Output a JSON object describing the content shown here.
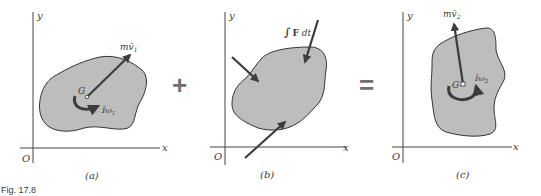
{
  "figure": {
    "caption": "Fig. 17.8",
    "operators": {
      "plus": "+",
      "equals": "="
    },
    "colors": {
      "body_fill": "#bdbdbd",
      "outline": "#333333",
      "arrow": "#3c3c3c",
      "axis": "#444444",
      "operator": "#707070"
    }
  },
  "panels": [
    {
      "id": "a",
      "label": "(a)",
      "axes": {
        "x": "x",
        "y": "y",
        "origin": "O"
      },
      "center_label": "G",
      "momentum_label": "mv̄",
      "momentum_sub": "1",
      "angular_label": "Īω",
      "angular_sub": "1"
    },
    {
      "id": "b",
      "label": "(b)",
      "axes": {
        "x": "x",
        "y": "y",
        "origin": "O"
      },
      "impulse_label_integral": "∫",
      "impulse_label_F": "F",
      "impulse_label_dt": "dt"
    },
    {
      "id": "c",
      "label": "(c)",
      "axes": {
        "x": "x",
        "y": "y",
        "origin": "O"
      },
      "center_label": "G",
      "momentum_label": "mv̄",
      "momentum_sub": "2",
      "angular_label": "Īω",
      "angular_sub": "2"
    }
  ]
}
